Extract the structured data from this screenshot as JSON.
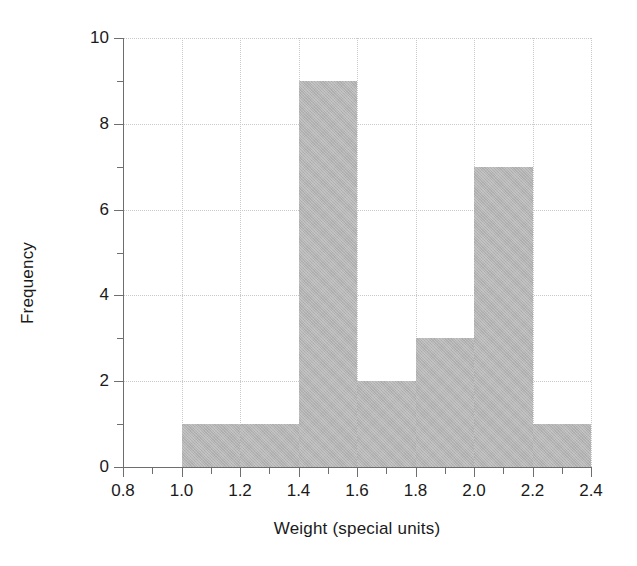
{
  "chart_data": {
    "type": "bar",
    "chart_subtype": "histogram",
    "title": "",
    "xlabel": "Weight (special units)",
    "ylabel": "Frequency",
    "xlim": [
      0.8,
      2.4
    ],
    "ylim": [
      0,
      10
    ],
    "grid": true,
    "legend": null,
    "bin_width": 0.2,
    "bin_edges": [
      1.0,
      1.2,
      1.4,
      1.6,
      1.8,
      2.0,
      2.2,
      2.4
    ],
    "categories": [
      "1.0-1.2",
      "1.2-1.4",
      "1.4-1.6",
      "1.6-1.8",
      "1.8-2.0",
      "2.0-2.2",
      "2.2-2.4"
    ],
    "values": [
      1,
      1,
      9,
      2,
      3,
      7,
      1
    ],
    "total_count": 24,
    "xticks": [
      {
        "value": 0.8,
        "label": "0.8"
      },
      {
        "value": 1.0,
        "label": "1.0"
      },
      {
        "value": 1.2,
        "label": "1.2"
      },
      {
        "value": 1.4,
        "label": "1.4"
      },
      {
        "value": 1.6,
        "label": "1.6"
      },
      {
        "value": 1.8,
        "label": "1.8"
      },
      {
        "value": 2.0,
        "label": "2.0"
      },
      {
        "value": 2.2,
        "label": "2.2"
      },
      {
        "value": 2.4,
        "label": "2.4"
      }
    ],
    "xticks_minor": [
      0.9,
      1.1,
      1.3,
      1.5,
      1.7,
      1.9,
      2.1,
      2.3
    ],
    "yticks": [
      {
        "value": 0,
        "label": "0"
      },
      {
        "value": 2,
        "label": "2"
      },
      {
        "value": 4,
        "label": "4"
      },
      {
        "value": 6,
        "label": "6"
      },
      {
        "value": 8,
        "label": "8"
      },
      {
        "value": 10,
        "label": "10"
      }
    ],
    "yticks_minor": [
      1,
      3,
      5,
      7,
      9
    ],
    "colors": {
      "bar_fill": "#b4b4b4",
      "axis": "#6e6e6e",
      "grid": "#c9c9c9",
      "text": "#1a1a1a",
      "background": "#ffffff"
    }
  }
}
